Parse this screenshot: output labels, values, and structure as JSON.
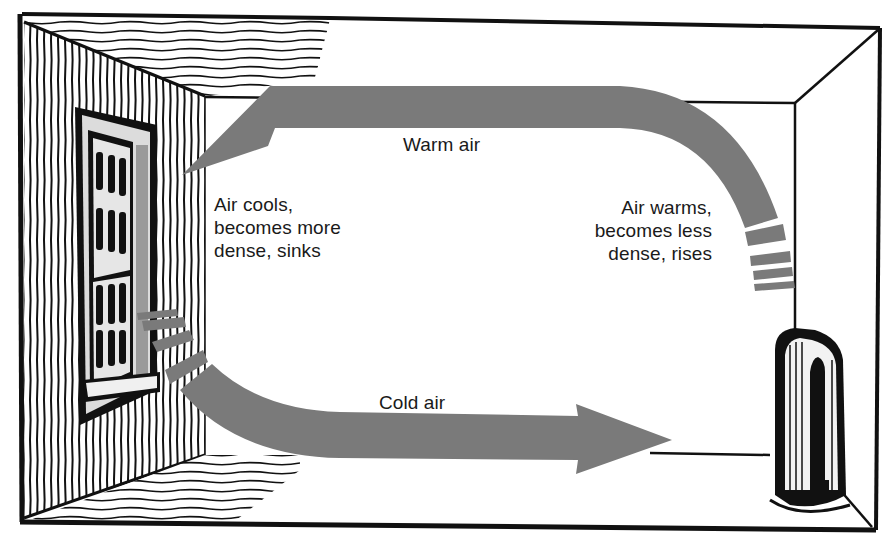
{
  "diagram": {
    "colors": {
      "ink": "#111111",
      "arrow": "#7a7a7a",
      "background": "#ffffff",
      "pane": "#d6d6d6"
    },
    "labels": {
      "warm_air": "Warm air",
      "cold_air": "Cold air",
      "air_cools": "Air cools,\nbecomes more\ndense, sinks",
      "air_warms": "Air warms,\nbecomes less\ndense, rises"
    },
    "objects": {
      "window": "window",
      "radiator": "radiator",
      "room": "room"
    },
    "flow": [
      {
        "from": "radiator",
        "to": "ceiling",
        "direction": "up",
        "note": "Air warms, becomes less dense, rises"
      },
      {
        "from": "ceiling-right",
        "to": "window",
        "direction": "left",
        "note": "Warm air"
      },
      {
        "from": "window",
        "to": "floor",
        "direction": "down",
        "note": "Air cools, becomes more dense, sinks"
      },
      {
        "from": "window",
        "to": "radiator",
        "direction": "right",
        "note": "Cold air"
      }
    ]
  }
}
